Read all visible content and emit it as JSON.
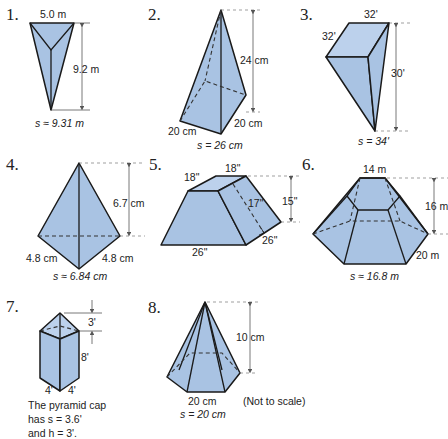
{
  "figures": [
    {
      "number": "1.",
      "top_edge": "5.0 m",
      "height": "9.2 m",
      "slant": "s ≈ 9.31 m"
    },
    {
      "number": "2.",
      "height": "24 cm",
      "base_left": "20 cm",
      "base_right": "20 cm",
      "slant": "s = 26 cm"
    },
    {
      "number": "3.",
      "top_edge": "32'",
      "side_edge": "32'",
      "height": "30'",
      "slant": "s = 34'"
    },
    {
      "number": "4.",
      "height": "6.7 cm",
      "base_left": "4.8 cm",
      "base_right": "4.8 cm",
      "slant": "s ≈ 6.84 cm"
    },
    {
      "number": "5.",
      "top_left": "18\"",
      "top_right": "18\"",
      "slant_height": "17\"",
      "height": "15\"",
      "base_right": "26\"",
      "base_front": "26\""
    },
    {
      "number": "6.",
      "top_edge": "14 m",
      "height": "16 m",
      "base_edge": "20 m",
      "slant": "s ≈ 16.8 m"
    },
    {
      "number": "7.",
      "cap_height": "3'",
      "prism_height": "8'",
      "base_left": "4'",
      "base_right": "4'",
      "note_line1": "The pyramid cap",
      "note_line2": "has s = 3.6'",
      "note_line3": "and  h = 3'."
    },
    {
      "number": "8.",
      "height": "10 cm",
      "base_edge": "20 cm",
      "slant": "s = 20 cm",
      "note": "(Not to scale)"
    }
  ],
  "colors": {
    "fill": "#a9c3e3",
    "stroke": "#1a1a1a"
  }
}
